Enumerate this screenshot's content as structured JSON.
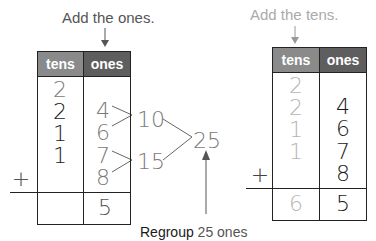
{
  "colors": {
    "tens_header": "#8a8a8a",
    "ones_header": "#5e5e5e",
    "gray_text": "#7a7a7a",
    "light_gray_text": "#b5b5b5",
    "dark_text": "#1a1a1a",
    "line": "#222222"
  },
  "left": {
    "caption": "Add the ones.",
    "headers": {
      "tens": "tens",
      "ones": "ones"
    },
    "tens_digits": [
      "2",
      "2",
      "1",
      "1"
    ],
    "ones_digits": [
      "4",
      "6",
      "7",
      "8"
    ],
    "plus": "+",
    "result_tens": "",
    "result_ones": "5",
    "partial_sums": [
      "10",
      "15"
    ],
    "total": "25",
    "regroup_label": "Regroup",
    "regroup_value": "25 ones"
  },
  "right": {
    "caption": "Add the tens.",
    "headers": {
      "tens": "tens",
      "ones": "ones"
    },
    "tens_digits": [
      "2",
      "2",
      "1",
      "1"
    ],
    "ones_digits": [
      "4",
      "6",
      "7",
      "8"
    ],
    "plus": "+",
    "result_tens": "6",
    "result_ones": "5"
  }
}
